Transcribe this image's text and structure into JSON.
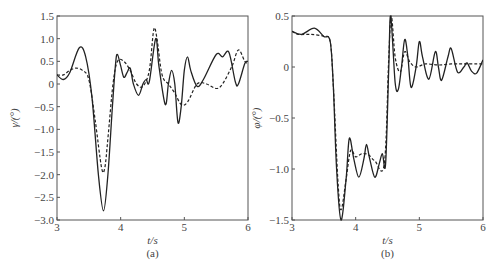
{
  "chart_data": [
    {
      "type": "line",
      "panel": "(a)",
      "caption": "(a)",
      "xlabel": "t/s",
      "ylabel": "γ/(°)",
      "xlim": [
        3,
        6
      ],
      "ylim": [
        -3.0,
        1.5
      ],
      "xticks": [
        3,
        4,
        5,
        6
      ],
      "xtick_labels": [
        "3",
        "4",
        "5",
        "6"
      ],
      "yticks": [
        1.5,
        1.0,
        0.5,
        0,
        -0.5,
        -1.0,
        -1.5,
        -2.0,
        -2.5,
        -3.0
      ],
      "ytick_labels": [
        "1.5",
        "1.0",
        "0.5",
        "0",
        "−0.5",
        "−1.0",
        "−1.5",
        "−2.0",
        "−2.5",
        "−3.0"
      ],
      "grid": false,
      "series": [
        {
          "name": "solid",
          "style": "solid",
          "points": [
            [
              3,
              0.2
            ],
            [
              3.1,
              0.1
            ],
            [
              3.2,
              0.25
            ],
            [
              3.35,
              0.8
            ],
            [
              3.45,
              0.6
            ],
            [
              3.55,
              -0.3
            ],
            [
              3.65,
              -2.0
            ],
            [
              3.73,
              -2.8
            ],
            [
              3.8,
              -2.0
            ],
            [
              3.87,
              -0.5
            ],
            [
              3.92,
              0.45
            ],
            [
              3.95,
              0.65
            ],
            [
              4.0,
              0.4
            ],
            [
              4.05,
              0.15
            ],
            [
              4.1,
              0.25
            ],
            [
              4.15,
              0.35
            ],
            [
              4.2,
              0.0
            ],
            [
              4.28,
              -0.25
            ],
            [
              4.35,
              0.0
            ],
            [
              4.4,
              0.1
            ],
            [
              4.45,
              0.05
            ],
            [
              4.55,
              1.0
            ],
            [
              4.6,
              0.4
            ],
            [
              4.7,
              -0.45
            ],
            [
              4.75,
              0.0
            ],
            [
              4.8,
              0.3
            ],
            [
              4.85,
              0.0
            ],
            [
              4.9,
              -0.85
            ],
            [
              4.95,
              -0.5
            ],
            [
              5.0,
              0.3
            ],
            [
              5.05,
              0.6
            ],
            [
              5.1,
              0.3
            ],
            [
              5.2,
              -0.05
            ],
            [
              5.3,
              0.1
            ],
            [
              5.5,
              0.65
            ],
            [
              5.6,
              0.6
            ],
            [
              5.7,
              0.7
            ],
            [
              5.8,
              0.05
            ],
            [
              5.85,
              0.0
            ],
            [
              5.95,
              0.45
            ],
            [
              6.0,
              0.5
            ]
          ]
        },
        {
          "name": "dashed",
          "style": "dashed",
          "points": [
            [
              3,
              0.2
            ],
            [
              3.1,
              0.2
            ],
            [
              3.2,
              0.3
            ],
            [
              3.3,
              0.35
            ],
            [
              3.4,
              0.3
            ],
            [
              3.5,
              0.1
            ],
            [
              3.6,
              -0.8
            ],
            [
              3.7,
              -1.85
            ],
            [
              3.75,
              -1.85
            ],
            [
              3.8,
              -1.2
            ],
            [
              3.88,
              0.0
            ],
            [
              3.95,
              0.5
            ],
            [
              4.05,
              0.5
            ],
            [
              4.15,
              0.3
            ],
            [
              4.25,
              0.0
            ],
            [
              4.35,
              -0.05
            ],
            [
              4.45,
              0.3
            ],
            [
              4.52,
              1.2
            ],
            [
              4.57,
              1.0
            ],
            [
              4.65,
              0.2
            ],
            [
              4.75,
              0.0
            ],
            [
              4.85,
              -0.2
            ],
            [
              4.95,
              -0.45
            ],
            [
              5.05,
              -0.4
            ],
            [
              5.2,
              0.0
            ],
            [
              5.35,
              0.0
            ],
            [
              5.5,
              -0.1
            ],
            [
              5.6,
              0.0
            ],
            [
              5.75,
              0.4
            ],
            [
              5.85,
              0.75
            ],
            [
              5.95,
              0.5
            ],
            [
              6.0,
              0.45
            ]
          ]
        }
      ]
    },
    {
      "type": "line",
      "panel": "(b)",
      "caption": "(b)",
      "xlabel": "t/s",
      "ylabel": "φ/(°)",
      "xlim": [
        3,
        6
      ],
      "ylim": [
        -1.5,
        0.5
      ],
      "xticks": [
        3,
        4,
        5,
        6
      ],
      "xtick_labels": [
        "3",
        "4",
        "5",
        "6"
      ],
      "yticks": [
        0.5,
        0,
        -0.5,
        -1.0,
        -1.5
      ],
      "ytick_labels": [
        "0.5",
        "0",
        "−0.5",
        "−1.0",
        "−1.5"
      ],
      "grid": false,
      "series": [
        {
          "name": "solid",
          "style": "solid",
          "points": [
            [
              3,
              0.35
            ],
            [
              3.15,
              0.32
            ],
            [
              3.35,
              0.38
            ],
            [
              3.5,
              0.3
            ],
            [
              3.6,
              0.25
            ],
            [
              3.65,
              -0.2
            ],
            [
              3.7,
              -1.0
            ],
            [
              3.77,
              -1.5
            ],
            [
              3.85,
              -1.1
            ],
            [
              3.9,
              -0.7
            ],
            [
              3.97,
              -0.9
            ],
            [
              4.05,
              -1.08
            ],
            [
              4.13,
              -0.9
            ],
            [
              4.17,
              -0.76
            ],
            [
              4.22,
              -0.9
            ],
            [
              4.3,
              -1.08
            ],
            [
              4.37,
              -0.95
            ],
            [
              4.42,
              -0.85
            ],
            [
              4.47,
              -0.95
            ],
            [
              4.52,
              0.0
            ],
            [
              4.55,
              0.5
            ],
            [
              4.62,
              -0.15
            ],
            [
              4.67,
              -0.22
            ],
            [
              4.72,
              0.0
            ],
            [
              4.77,
              0.27
            ],
            [
              4.82,
              0.1
            ],
            [
              4.87,
              -0.2
            ],
            [
              4.95,
              0.0
            ],
            [
              5.0,
              0.25
            ],
            [
              5.05,
              0.1
            ],
            [
              5.15,
              -0.12
            ],
            [
              5.25,
              0.15
            ],
            [
              5.3,
              0.0
            ],
            [
              5.35,
              -0.13
            ],
            [
              5.45,
              0.1
            ],
            [
              5.5,
              0.18
            ],
            [
              5.6,
              -0.05
            ],
            [
              5.7,
              0.0
            ],
            [
              5.75,
              0.04
            ],
            [
              5.82,
              -0.04
            ],
            [
              5.9,
              -0.06
            ],
            [
              6.0,
              0.07
            ]
          ]
        },
        {
          "name": "dashed",
          "style": "dashed",
          "points": [
            [
              3,
              0.35
            ],
            [
              3.1,
              0.32
            ],
            [
              3.3,
              0.32
            ],
            [
              3.5,
              0.3
            ],
            [
              3.6,
              0.25
            ],
            [
              3.65,
              -0.2
            ],
            [
              3.72,
              -1.1
            ],
            [
              3.77,
              -1.4
            ],
            [
              3.85,
              -1.1
            ],
            [
              3.92,
              -0.82
            ],
            [
              4.0,
              -0.88
            ],
            [
              4.1,
              -0.85
            ],
            [
              4.2,
              -0.86
            ],
            [
              4.3,
              -0.92
            ],
            [
              4.45,
              -0.95
            ],
            [
              4.52,
              0.1
            ],
            [
              4.56,
              0.5
            ],
            [
              4.62,
              0.1
            ],
            [
              4.7,
              -0.05
            ],
            [
              4.77,
              0.15
            ],
            [
              4.85,
              0.05
            ],
            [
              4.95,
              0.0
            ],
            [
              5.1,
              0.03
            ],
            [
              5.3,
              0.02
            ],
            [
              5.5,
              0.03
            ],
            [
              5.7,
              0.03
            ],
            [
              5.9,
              0.03
            ],
            [
              6.0,
              0.03
            ]
          ]
        }
      ]
    }
  ],
  "colors": {
    "line": "#222222",
    "axis": "#555555",
    "text": "#444444"
  }
}
